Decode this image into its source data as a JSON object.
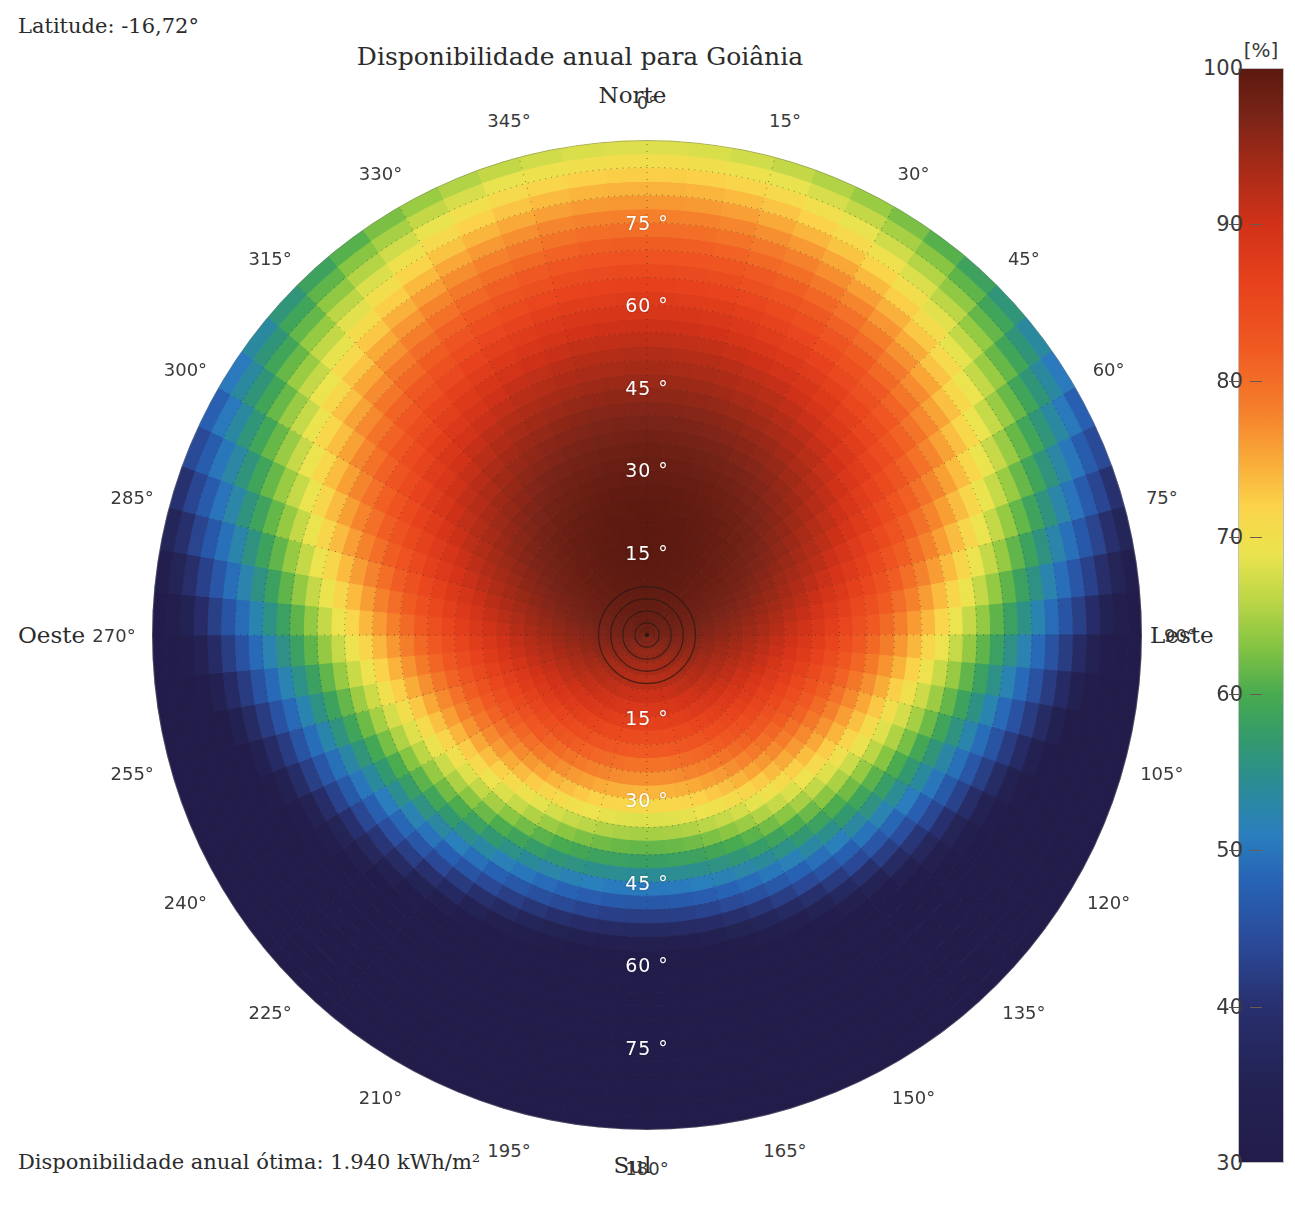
{
  "header": {
    "latitude_label": "Latitude: -16,72°",
    "title": "Disponibilidade anual para Goiânia"
  },
  "footer": {
    "caption": "Disponibilidade anual ótima: 1.940 kWh/m²"
  },
  "cardinals": {
    "north": "Norte",
    "south": "Sul",
    "east": "Leste",
    "west": "Oeste"
  },
  "colorbar": {
    "unit": "[%]",
    "min": 30,
    "max": 100,
    "ticks": [
      100,
      90,
      80,
      70,
      60,
      50,
      40,
      30
    ],
    "tick_labels": [
      "100",
      "90",
      "80",
      "70",
      "60",
      "50",
      "40",
      "30"
    ],
    "stops": [
      {
        "v": 100,
        "color": "#5c190f"
      },
      {
        "v": 97,
        "color": "#7a2418"
      },
      {
        "v": 94,
        "color": "#a32a17"
      },
      {
        "v": 90,
        "color": "#d23218"
      },
      {
        "v": 86,
        "color": "#e8431d"
      },
      {
        "v": 82,
        "color": "#f05a22"
      },
      {
        "v": 78,
        "color": "#f5812c"
      },
      {
        "v": 75,
        "color": "#f9a937"
      },
      {
        "v": 72,
        "color": "#fbd34a"
      },
      {
        "v": 69,
        "color": "#ece44f"
      },
      {
        "v": 66,
        "color": "#bcd646"
      },
      {
        "v": 63,
        "color": "#84c442"
      },
      {
        "v": 60,
        "color": "#49ab4f"
      },
      {
        "v": 57,
        "color": "#32996d"
      },
      {
        "v": 54,
        "color": "#2b8b98"
      },
      {
        "v": 51,
        "color": "#2a7fbe"
      },
      {
        "v": 48,
        "color": "#2763b5"
      },
      {
        "v": 44,
        "color": "#2a4a98"
      },
      {
        "v": 40,
        "color": "#28306f"
      },
      {
        "v": 35,
        "color": "#232253"
      },
      {
        "v": 30,
        "color": "#221c4a"
      }
    ]
  },
  "chart_data": {
    "type": "heatmap",
    "projection": "polar",
    "title": "Disponibilidade anual para Goiânia",
    "subtitle": "Latitude: -16,72°",
    "value_unit": "%",
    "value_description": "Disponibilidade anual relativa ao ótimo",
    "optimum_annual": "1.940 kWh/m²",
    "grid": true,
    "legend_position": "right",
    "angular_axis": {
      "label": "Azimute",
      "unit": "°",
      "min": 0,
      "max": 360,
      "tick_step": 15,
      "zero_at": "north",
      "direction": "clockwise",
      "tick_labels": [
        "0°",
        "15°",
        "30°",
        "45°",
        "60°",
        "75°",
        "90°",
        "105°",
        "120°",
        "135°",
        "150°",
        "165°",
        "180°",
        "195°",
        "210°",
        "225°",
        "240°",
        "255°",
        "270°",
        "285°",
        "300°",
        "315°",
        "330°",
        "345°"
      ]
    },
    "radial_axis": {
      "label": "Inclinação",
      "unit": "°",
      "min": 0,
      "max": 90,
      "tick_step": 15,
      "tick_labels": [
        "15 °",
        "30 °",
        "45 °",
        "60 °",
        "75 °"
      ],
      "tick_values": [
        15,
        30,
        45,
        60,
        75
      ],
      "label_azimuths": [
        0,
        180
      ]
    },
    "zlim": [
      30,
      100
    ],
    "optimum_point": {
      "azimuth": 0,
      "tilt": 17,
      "value": 100
    },
    "model": {
      "note": "Value as function of azimuth A (deg from North, clockwise) and tilt T (deg). Fit reproduces the plotted field.",
      "peak_value": 100,
      "peak_tilt": 17,
      "peak_azimuth": 0,
      "tilt_falloff_north": 0.0062,
      "tilt_falloff_south": 0.0115,
      "azimuth_weight": 0.7
    },
    "samples": [
      {
        "azimuth": 0,
        "tilt": 0,
        "value": 96
      },
      {
        "azimuth": 0,
        "tilt": 15,
        "value": 100
      },
      {
        "azimuth": 0,
        "tilt": 30,
        "value": 100
      },
      {
        "azimuth": 0,
        "tilt": 45,
        "value": 96
      },
      {
        "azimuth": 0,
        "tilt": 60,
        "value": 84
      },
      {
        "azimuth": 0,
        "tilt": 75,
        "value": 69
      },
      {
        "azimuth": 0,
        "tilt": 90,
        "value": 58
      },
      {
        "azimuth": 45,
        "tilt": 15,
        "value": 99
      },
      {
        "azimuth": 45,
        "tilt": 30,
        "value": 95
      },
      {
        "azimuth": 45,
        "tilt": 45,
        "value": 88
      },
      {
        "azimuth": 45,
        "tilt": 60,
        "value": 77
      },
      {
        "azimuth": 45,
        "tilt": 75,
        "value": 65
      },
      {
        "azimuth": 45,
        "tilt": 90,
        "value": 55
      },
      {
        "azimuth": 90,
        "tilt": 15,
        "value": 96
      },
      {
        "azimuth": 90,
        "tilt": 30,
        "value": 88
      },
      {
        "azimuth": 90,
        "tilt": 45,
        "value": 77
      },
      {
        "azimuth": 90,
        "tilt": 60,
        "value": 65
      },
      {
        "azimuth": 90,
        "tilt": 75,
        "value": 55
      },
      {
        "azimuth": 90,
        "tilt": 90,
        "value": 47
      },
      {
        "azimuth": 135,
        "tilt": 15,
        "value": 93
      },
      {
        "azimuth": 135,
        "tilt": 30,
        "value": 80
      },
      {
        "azimuth": 135,
        "tilt": 45,
        "value": 65
      },
      {
        "azimuth": 135,
        "tilt": 60,
        "value": 51
      },
      {
        "azimuth": 135,
        "tilt": 75,
        "value": 41
      },
      {
        "azimuth": 135,
        "tilt": 90,
        "value": 35
      },
      {
        "azimuth": 180,
        "tilt": 15,
        "value": 90
      },
      {
        "azimuth": 180,
        "tilt": 30,
        "value": 74
      },
      {
        "azimuth": 180,
        "tilt": 45,
        "value": 57
      },
      {
        "azimuth": 180,
        "tilt": 60,
        "value": 43
      },
      {
        "azimuth": 180,
        "tilt": 75,
        "value": 34
      },
      {
        "azimuth": 180,
        "tilt": 90,
        "value": 30
      },
      {
        "azimuth": 225,
        "tilt": 15,
        "value": 93
      },
      {
        "azimuth": 225,
        "tilt": 30,
        "value": 80
      },
      {
        "azimuth": 225,
        "tilt": 45,
        "value": 65
      },
      {
        "azimuth": 225,
        "tilt": 60,
        "value": 51
      },
      {
        "azimuth": 225,
        "tilt": 75,
        "value": 41
      },
      {
        "azimuth": 225,
        "tilt": 90,
        "value": 35
      },
      {
        "azimuth": 270,
        "tilt": 15,
        "value": 96
      },
      {
        "azimuth": 270,
        "tilt": 30,
        "value": 88
      },
      {
        "azimuth": 270,
        "tilt": 45,
        "value": 77
      },
      {
        "azimuth": 270,
        "tilt": 60,
        "value": 65
      },
      {
        "azimuth": 270,
        "tilt": 75,
        "value": 55
      },
      {
        "azimuth": 270,
        "tilt": 90,
        "value": 48
      },
      {
        "azimuth": 315,
        "tilt": 15,
        "value": 99
      },
      {
        "azimuth": 315,
        "tilt": 30,
        "value": 95
      },
      {
        "azimuth": 315,
        "tilt": 45,
        "value": 88
      },
      {
        "azimuth": 315,
        "tilt": 60,
        "value": 77
      },
      {
        "azimuth": 315,
        "tilt": 75,
        "value": 65
      },
      {
        "azimuth": 315,
        "tilt": 90,
        "value": 56
      }
    ]
  },
  "geometry": {
    "center_x": 647,
    "center_y": 635,
    "radius": 495
  }
}
